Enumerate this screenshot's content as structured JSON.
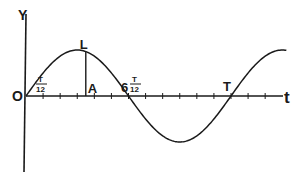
{
  "diagram": {
    "type": "sine-wave-displacement-time",
    "axes": {
      "y_label": "Y",
      "x_label": "t",
      "origin_label": "O"
    },
    "period_label": "T",
    "tick_divisions_per_period": 12,
    "ticks_shown": 14,
    "points": {
      "L": {
        "label": "L",
        "description": "point on curve above A"
      },
      "A": {
        "label": "A",
        "description": "foot of perpendicular on t-axis"
      }
    },
    "annotations": {
      "first_tick": {
        "num": "T",
        "den": "12"
      },
      "half_period": {
        "coef": "6",
        "num": "T",
        "den": "12"
      },
      "full_period": "T"
    },
    "curve": {
      "function": "sin",
      "phase_start": 0,
      "periods_shown": 1.27
    },
    "colors": {
      "ink": "#1a1a1a",
      "background": "#ffffff"
    }
  }
}
